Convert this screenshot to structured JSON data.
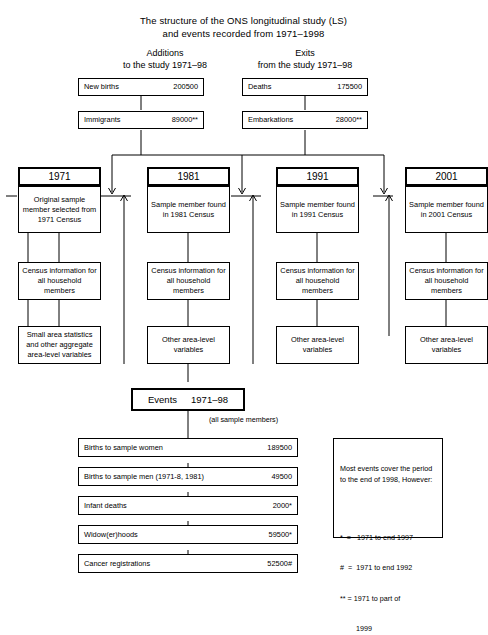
{
  "title": {
    "line1": "The structure of the ONS longitudinal study (LS)",
    "line2": "and events recorded from 1971–1998"
  },
  "columns": {
    "additions": {
      "line1": "Additions",
      "line2": "to the study 1971–98"
    },
    "exits": {
      "line1": "Exits",
      "line2": "from the study 1971–98"
    }
  },
  "flows": {
    "additions": [
      {
        "label": "New births",
        "value": "200500"
      },
      {
        "label": "Immigrants",
        "value": "89000**"
      }
    ],
    "exits": [
      {
        "label": "Deaths",
        "value": "175500"
      },
      {
        "label": "Embarkations",
        "value": "28000**"
      }
    ]
  },
  "census_columns": [
    {
      "year": "1971",
      "member": "Original sample member selected from 1971 Census",
      "household": "Census information for all household members",
      "area": "Small area statistics and other aggregate area-level variables"
    },
    {
      "year": "1981",
      "member": "Sample member found in 1981 Census",
      "household": "Census information for all household members",
      "area": "Other area-level variables"
    },
    {
      "year": "1991",
      "member": "Sample member found in 1991 Census",
      "household": "Census information for all household members",
      "area": "Other area-level variables"
    },
    {
      "year": "2001",
      "member": "Sample member found in 2001 Census",
      "household": "Census information for all household members",
      "area": "Other area-level variables"
    }
  ],
  "events": {
    "heading_label": "Events",
    "heading_period": "1971–98",
    "caption": "(all sample members)",
    "rows": [
      {
        "label": "Births to sample women",
        "value": "189500"
      },
      {
        "label": "Births to sample men (1971-8,  1981)",
        "value": "49500"
      },
      {
        "label": "Infant deaths",
        "value": "2000*"
      },
      {
        "label": "Widow(er)hoods",
        "value": "59500*"
      },
      {
        "label": "Cancer registrations",
        "value": "52500#"
      }
    ]
  },
  "notes": {
    "intro": "Most events cover the period to the end of 1998, However:",
    "legend": [
      "*  =   1971 to end 1997",
      "#  =  1971 to end 1992",
      "** = 1971 to part of",
      "        1999"
    ]
  }
}
